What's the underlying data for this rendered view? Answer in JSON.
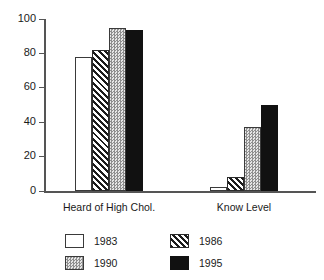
{
  "chart_data": {
    "type": "bar",
    "title": "",
    "subtitle": "",
    "xlabel": "",
    "ylabel": "",
    "ylim": [
      0,
      100
    ],
    "yticks": [
      0,
      20,
      40,
      60,
      80,
      100
    ],
    "ytick_labels": [
      "0",
      "20",
      "40",
      "60",
      "80",
      "100"
    ],
    "grid": false,
    "legend_position": "bottom",
    "categories": [
      "Heard of High Chol.",
      "Know Level"
    ],
    "series": [
      {
        "name": "1983",
        "values": [
          78,
          2.5
        ],
        "fill": "white",
        "color": "#ffffff"
      },
      {
        "name": "1986",
        "values": [
          82,
          8
        ],
        "fill": "diagonal-hatch",
        "color": "#1c1c1c"
      },
      {
        "name": "1990",
        "values": [
          95,
          37.5
        ],
        "fill": "dotted-gray",
        "color": "#c9c9c9"
      },
      {
        "name": "1995",
        "values": [
          93.5,
          50
        ],
        "fill": "solid-black",
        "color": "#111111"
      }
    ]
  },
  "axis": {
    "y_tick_0": "0",
    "y_tick_1": "20",
    "y_tick_2": "40",
    "y_tick_3": "60",
    "y_tick_4": "80",
    "y_tick_5": "100"
  },
  "categories": {
    "group_0": "Heard of High Chol.",
    "group_1": "Know Level"
  },
  "legend": {
    "items": [
      {
        "label": "1983"
      },
      {
        "label": "1986"
      },
      {
        "label": "1990"
      },
      {
        "label": "1995"
      }
    ]
  }
}
